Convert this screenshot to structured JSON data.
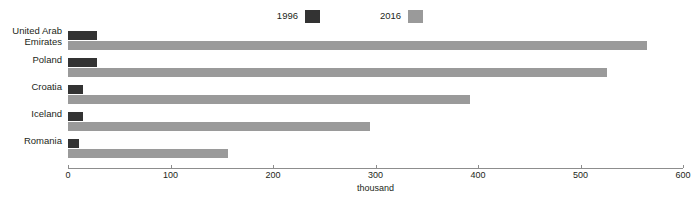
{
  "title_sliver": "",
  "footer_sliver": "",
  "legend": {
    "items": [
      {
        "label": "1996",
        "color": "#333333",
        "swatch_name": "legend-swatch-1996"
      },
      {
        "label": "2016",
        "color": "#9a9a9a",
        "swatch_name": "legend-swatch-2016"
      }
    ]
  },
  "axis": {
    "title": "thousand",
    "ticks": [
      "0",
      "100",
      "200",
      "300",
      "400",
      "500",
      "600"
    ]
  },
  "chart_data": {
    "type": "bar",
    "orientation": "horizontal",
    "title": "",
    "xlabel": "thousand",
    "ylabel": "",
    "xlim": [
      0,
      600
    ],
    "xticks": [
      0,
      100,
      200,
      300,
      400,
      500,
      600
    ],
    "grid": false,
    "legend_position": "top-center",
    "categories": [
      "United Arab Emirates",
      "Poland",
      "Croatia",
      "Iceland",
      "Romania"
    ],
    "category_labels": [
      "United Arab\nEmirates",
      "Poland",
      "Croatia",
      "Iceland",
      "Romania"
    ],
    "series": [
      {
        "name": "1996",
        "color": "#333333",
        "values": [
          28,
          28,
          15,
          15,
          11
        ]
      },
      {
        "name": "2016",
        "color": "#9a9a9a",
        "values": [
          565,
          526,
          392,
          295,
          156
        ]
      }
    ]
  }
}
